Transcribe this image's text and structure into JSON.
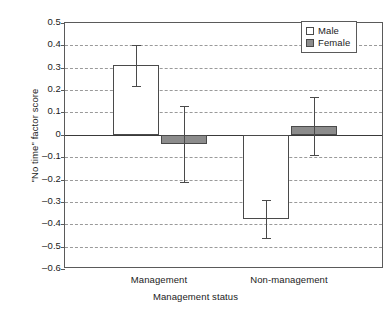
{
  "chart_data": {
    "type": "bar",
    "title": "",
    "xlabel": "Management status",
    "ylabel": "\"No time\" factor score",
    "categories": [
      "Management",
      "Non-management"
    ],
    "ylim": [
      -0.6,
      0.5
    ],
    "ytick_labels": [
      "0.5",
      "0.4",
      "0.3",
      "0.2",
      "0.1",
      "0",
      "–0.1",
      "–0.2",
      "–0.3",
      "–0.4",
      "–0.5",
      "–0.6"
    ],
    "ytick_values": [
      0.5,
      0.4,
      0.3,
      0.2,
      0.1,
      0,
      -0.1,
      -0.2,
      -0.3,
      -0.4,
      -0.5,
      -0.6
    ],
    "grid": true,
    "legend_position": "top-right",
    "series": [
      {
        "name": "Male",
        "color": "#ffffff",
        "edge_color": "#4a4a4a",
        "values": [
          0.31,
          -0.375
        ],
        "error_low": [
          0.22,
          -0.46
        ],
        "error_high": [
          0.4,
          -0.29
        ]
      },
      {
        "name": "Female",
        "color": "#8c8c8c",
        "edge_color": "#4a4a4a",
        "values": [
          -0.04,
          0.04
        ],
        "error_low": [
          -0.21,
          -0.09
        ],
        "error_high": [
          0.13,
          0.17
        ]
      }
    ]
  },
  "legend": {
    "entries": [
      {
        "label": "Male"
      },
      {
        "label": "Female"
      }
    ]
  },
  "axes": {
    "x_title": "Management status",
    "y_title": "\"No time\" factor score"
  }
}
